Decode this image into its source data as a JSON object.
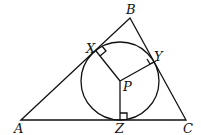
{
  "diagram": {
    "type": "geometry",
    "labels": {
      "A": "A",
      "B": "B",
      "C": "C",
      "X": "X",
      "Y": "Y",
      "Z": "Z",
      "P": "P"
    },
    "colors": {
      "stroke": "#111111",
      "background": "#ffffff"
    }
  }
}
